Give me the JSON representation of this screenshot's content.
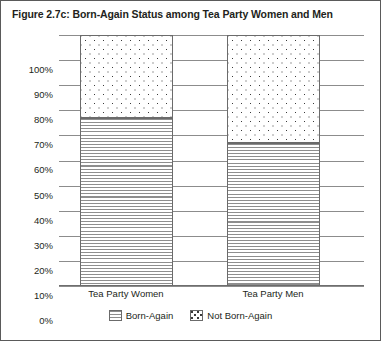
{
  "figure": {
    "title": "Figure 2.7c: Born-Again Status among Tea Party Women and Men"
  },
  "chart_data": {
    "type": "bar",
    "stacked": true,
    "normalized_percent": true,
    "title": "Figure 2.7c: Born-Again Status among Tea Party Women and Men",
    "xlabel": "",
    "ylabel": "",
    "ylim": [
      0,
      100
    ],
    "ytick_labels": [
      "100%",
      "90%",
      "80%",
      "70%",
      "60%",
      "50%",
      "40%",
      "30%",
      "20%",
      "10%",
      "0%"
    ],
    "ytick_values": [
      100,
      90,
      80,
      70,
      60,
      50,
      40,
      30,
      20,
      10,
      0
    ],
    "grid": true,
    "legend_position": "bottom",
    "categories": [
      "Tea Party Women",
      "Tea Party Men"
    ],
    "series": [
      {
        "name": "Born-Again",
        "pattern": "horizontal-lines",
        "values": [
          67,
          57
        ]
      },
      {
        "name": "Not Born-Again",
        "pattern": "dots",
        "values": [
          33,
          43
        ]
      }
    ]
  }
}
